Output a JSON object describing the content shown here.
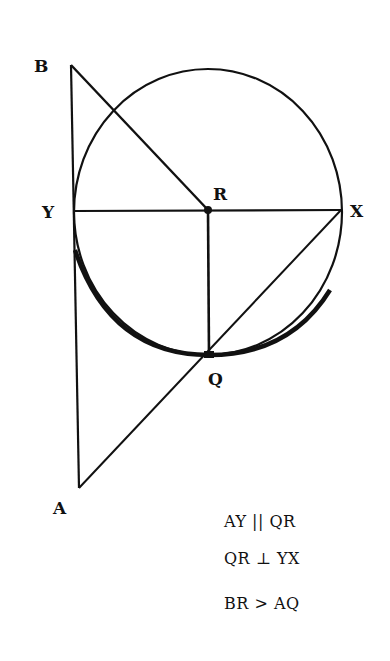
{
  "diagram": {
    "type": "geometry",
    "points": {
      "B": {
        "label": "B",
        "x": 71,
        "y": 65
      },
      "Y": {
        "label": "Y",
        "x": 73,
        "y": 210
      },
      "R": {
        "label": "R",
        "x": 208,
        "y": 210
      },
      "X": {
        "label": "X",
        "x": 341,
        "y": 210
      },
      "Q": {
        "label": "Q",
        "x": 209,
        "y": 355
      },
      "A": {
        "label": "A",
        "x": 79,
        "y": 488
      }
    },
    "segments": [
      "BA",
      "BR",
      "YX",
      "RQ",
      "XA"
    ],
    "circle": {
      "center": "R",
      "rx": 134,
      "ry": 145
    },
    "highlighted_arc": "Y to Q to X (lower)",
    "notes": [
      "AY || QR",
      "QR ⊥ YX",
      "BR > AQ"
    ]
  }
}
